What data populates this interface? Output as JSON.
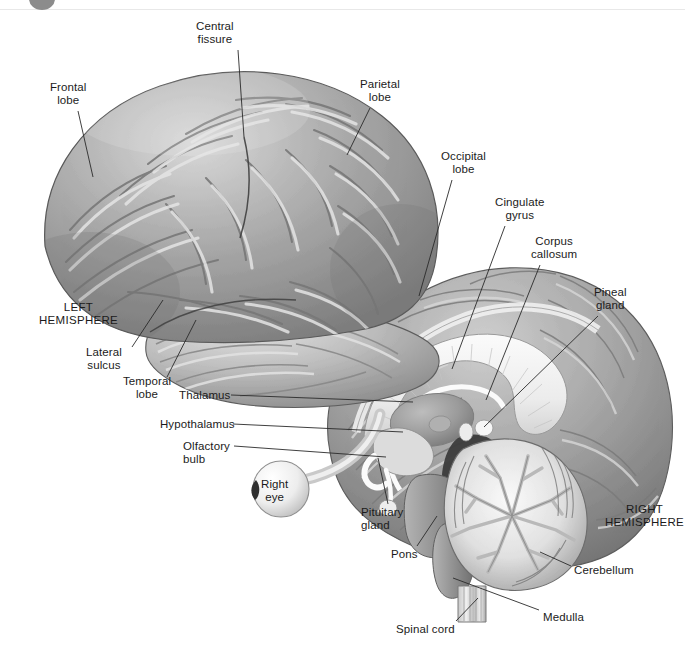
{
  "figure": {
    "background_color": "#ffffff",
    "label_color": "#1b1b1b",
    "leader_line_color": "#2a2a2a",
    "cortex_fill": "#9a9a9a",
    "cortex_highlight": "#d6d6d6",
    "cortex_shadow": "#6f6f6f",
    "white_matter_fill": "#f2f2f2",
    "deep_shadow": "#4a4a4a",
    "outline_color": "#5a5a5a"
  },
  "artifacts": {
    "corner_dot": {
      "name": "partial-grey-circle",
      "color": "#8c8c8c"
    },
    "top_rule": {
      "name": "top-edge-line",
      "color": "#e8e8e8"
    }
  },
  "labels": [
    {
      "id": "central-fissure",
      "text_lines": [
        "Central",
        "fissure"
      ],
      "text": "Central fissure",
      "x": 196,
      "y": 20,
      "align": "center",
      "caps": false,
      "leader": {
        "x1": 238,
        "y1": 50,
        "x2": 244,
        "y2": 137
      }
    },
    {
      "id": "frontal-lobe",
      "text_lines": [
        "Frontal",
        "lobe"
      ],
      "text": "Frontal lobe",
      "x": 50,
      "y": 81,
      "align": "center",
      "caps": false,
      "leader": {
        "x1": 78,
        "y1": 111,
        "x2": 93,
        "y2": 177
      }
    },
    {
      "id": "parietal-lobe",
      "text_lines": [
        "Parietal",
        "lobe"
      ],
      "text": "Parietal lobe",
      "x": 360,
      "y": 78,
      "align": "center",
      "caps": false,
      "leader": {
        "x1": 370,
        "y1": 108,
        "x2": 347,
        "y2": 155
      }
    },
    {
      "id": "occipital-lobe",
      "text_lines": [
        "Occipital",
        "lobe"
      ],
      "text": "Occipital lobe",
      "x": 441,
      "y": 150,
      "align": "center",
      "caps": false,
      "leader": {
        "x1": 452,
        "y1": 180,
        "x2": 419,
        "y2": 296
      }
    },
    {
      "id": "cingulate-gyrus",
      "text_lines": [
        "Cingulate",
        "gyrus"
      ],
      "text": "Cingulate gyrus",
      "x": 495,
      "y": 196,
      "align": "center",
      "caps": false,
      "leader": {
        "x1": 505,
        "y1": 226,
        "x2": 452,
        "y2": 369
      }
    },
    {
      "id": "corpus-callosum",
      "text_lines": [
        "Corpus",
        "callosum"
      ],
      "text": "Corpus callosum",
      "x": 531,
      "y": 235,
      "align": "center",
      "caps": false,
      "leader": {
        "x1": 540,
        "y1": 265,
        "x2": 486,
        "y2": 400
      }
    },
    {
      "id": "pineal-gland",
      "text_lines": [
        "Pineal",
        "gland"
      ],
      "text": "Pineal gland",
      "x": 594,
      "y": 286,
      "align": "center",
      "caps": false,
      "leader": {
        "x1": 598,
        "y1": 316,
        "x2": 484,
        "y2": 427
      }
    },
    {
      "id": "left-hemisphere",
      "text_lines": [
        "LEFT",
        "HEMISPHERE"
      ],
      "text": "LEFT HEMISPHERE",
      "x": 39,
      "y": 301,
      "align": "center",
      "caps": true,
      "leader": null
    },
    {
      "id": "lateral-sulcus",
      "text_lines": [
        "Lateral",
        "sulcus"
      ],
      "text": "Lateral sulcus",
      "x": 86,
      "y": 346,
      "align": "center",
      "caps": false,
      "leader": {
        "x1": 132,
        "y1": 347,
        "x2": 163,
        "y2": 300
      }
    },
    {
      "id": "temporal-lobe",
      "text_lines": [
        "Temporal",
        "lobe"
      ],
      "text": "Temporal lobe",
      "x": 123,
      "y": 375,
      "align": "center",
      "caps": false,
      "leader": {
        "x1": 167,
        "y1": 377,
        "x2": 196,
        "y2": 320
      }
    },
    {
      "id": "thalamus",
      "text_lines": [
        "Thalamus"
      ],
      "text": "Thalamus",
      "x": 180,
      "y": 389,
      "align": "right",
      "caps": false,
      "leader": {
        "x1": 231,
        "y1": 395,
        "x2": 413,
        "y2": 402
      }
    },
    {
      "id": "hypothalamus",
      "text_lines": [
        "Hypothalamus"
      ],
      "text": "Hypothalamus",
      "x": 159,
      "y": 418,
      "align": "right",
      "caps": false,
      "leader": {
        "x1": 233,
        "y1": 424,
        "x2": 403,
        "y2": 432
      }
    },
    {
      "id": "olfactory-bulb",
      "text_lines": [
        "Olfactory",
        "bulb"
      ],
      "text": "Olfactory bulb",
      "x": 183,
      "y": 440,
      "align": "left",
      "caps": false,
      "leader": {
        "x1": 234,
        "y1": 446,
        "x2": 386,
        "y2": 457
      }
    },
    {
      "id": "right-eye",
      "text_lines": [
        "Right",
        "eye"
      ],
      "text": "Right eye",
      "x": 261,
      "y": 478,
      "align": "center",
      "caps": false,
      "leader": null
    },
    {
      "id": "pituitary-gland",
      "text_lines": [
        "Pituitary",
        "gland"
      ],
      "text": "Pituitary gland",
      "x": 361,
      "y": 506,
      "align": "left",
      "caps": false,
      "leader": {
        "x1": 388,
        "y1": 504,
        "x2": 378,
        "y2": 458
      }
    },
    {
      "id": "right-hemisphere",
      "text_lines": [
        "RIGHT",
        "HEMISPHERE"
      ],
      "text": "RIGHT HEMISPHERE",
      "x": 605,
      "y": 503,
      "align": "center",
      "caps": true,
      "leader": null
    },
    {
      "id": "pons",
      "text_lines": [
        "Pons"
      ],
      "text": "Pons",
      "x": 391,
      "y": 548,
      "align": "left",
      "caps": false,
      "leader": {
        "x1": 417,
        "y1": 546,
        "x2": 437,
        "y2": 516
      }
    },
    {
      "id": "cerebellum",
      "text_lines": [
        "Cerebellum"
      ],
      "text": "Cerebellum",
      "x": 574,
      "y": 564,
      "align": "left",
      "caps": false,
      "leader": {
        "x1": 571,
        "y1": 566,
        "x2": 540,
        "y2": 552
      }
    },
    {
      "id": "medulla",
      "text_lines": [
        "Medulla"
      ],
      "text": "Medulla",
      "x": 543,
      "y": 611,
      "align": "left",
      "caps": false,
      "leader": {
        "x1": 539,
        "y1": 610,
        "x2": 453,
        "y2": 578
      }
    },
    {
      "id": "spinal-cord",
      "text_lines": [
        "Spinal cord"
      ],
      "text": "Spinal cord",
      "x": 396,
      "y": 623,
      "align": "left",
      "caps": false,
      "leader": {
        "x1": 456,
        "y1": 621,
        "x2": 478,
        "y2": 598
      }
    }
  ],
  "structures": [
    {
      "id": "left-cerebrum",
      "name": "left-hemisphere-lateral-surface"
    },
    {
      "id": "temporal-lobe-shape",
      "name": "temporal-lobe"
    },
    {
      "id": "right-cerebrum-sagittal",
      "name": "right-hemisphere-midsagittal"
    },
    {
      "id": "corpus-callosum-shape",
      "name": "corpus-callosum"
    },
    {
      "id": "thalamus-shape",
      "name": "thalamus"
    },
    {
      "id": "hypothalamus-shape",
      "name": "hypothalamus"
    },
    {
      "id": "pituitary-shape",
      "name": "pituitary-gland"
    },
    {
      "id": "pons-shape",
      "name": "pons"
    },
    {
      "id": "medulla-shape",
      "name": "medulla"
    },
    {
      "id": "spinal-cord-shape",
      "name": "spinal-cord"
    },
    {
      "id": "cerebellum-shape",
      "name": "cerebellum-arbor-vitae"
    },
    {
      "id": "eye-shape",
      "name": "right-eye"
    },
    {
      "id": "optic-nerve-shape",
      "name": "optic-nerve"
    },
    {
      "id": "pineal-shape",
      "name": "pineal-gland"
    },
    {
      "id": "midbrain-shadow",
      "name": "midbrain-cavity"
    }
  ]
}
